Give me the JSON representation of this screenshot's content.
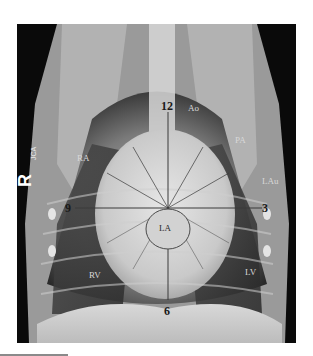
{
  "figure": {
    "type": "thoracic-radiograph",
    "view": "dorsoventral",
    "side_marker": "R",
    "side_marker_sub": "JCA",
    "clock_labels": {
      "top": "12",
      "right": "3",
      "bottom": "6",
      "left": "9"
    },
    "structure_labels": {
      "aorta": "Ao",
      "pulmonary_artery": "PA",
      "left_auricle": "LAu",
      "right_atrium": "RA",
      "left_atrium": "LA",
      "right_ventricle": "RV",
      "left_ventricle": "LV"
    },
    "colors": {
      "annotation_line": "#3a3a3a",
      "background": "#ffffff",
      "film_dark": "#0a0a0a"
    }
  }
}
